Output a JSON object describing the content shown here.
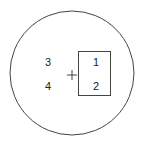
{
  "diagram": {
    "circle": {
      "cx": 72,
      "cy": 73,
      "r": 62,
      "stroke": "#444444"
    },
    "rectangle": {
      "x": 78,
      "y": 51,
      "width": 33,
      "height": 44,
      "stroke": "#444444"
    },
    "cross": {
      "x": 72,
      "y": 75,
      "symbol": "+"
    },
    "labels": [
      {
        "id": "3",
        "text": "3"
      },
      {
        "id": "4",
        "text": "4"
      },
      {
        "id": "1",
        "text": "1"
      },
      {
        "id": "2",
        "text": "2"
      }
    ]
  }
}
